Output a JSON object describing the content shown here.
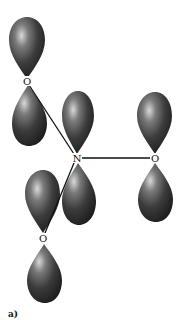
{
  "figure": {
    "caption": "a)",
    "colors": {
      "lobe_dark": "#2a2a2a",
      "lobe_mid": "#555555",
      "lobe_highlight": "#d9d9d9",
      "bond": "#111111",
      "background": "#ffffff"
    },
    "atoms": [
      {
        "id": "O1",
        "label": "O",
        "x": 27,
        "y": 82
      },
      {
        "id": "N",
        "label": "N",
        "x": 77,
        "y": 158
      },
      {
        "id": "O2",
        "label": "O",
        "x": 155,
        "y": 158
      },
      {
        "id": "O3",
        "label": "O",
        "x": 43,
        "y": 238
      }
    ],
    "bonds": [
      {
        "from": "O1",
        "to": "N"
      },
      {
        "from": "N",
        "to": "O2"
      },
      {
        "from": "N",
        "to": "O3"
      }
    ],
    "orbital": "p-orbital"
  }
}
